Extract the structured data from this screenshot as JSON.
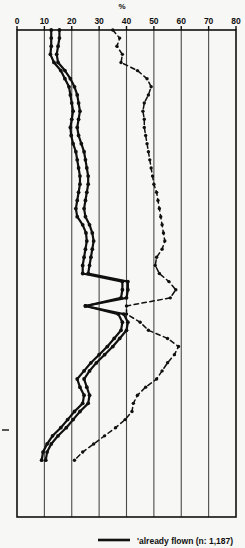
{
  "chart_data": {
    "type": "line",
    "title": "",
    "subtitle": "",
    "xlabel": "%",
    "ylabel": "",
    "xlim": [
      0,
      80
    ],
    "ylim": [
      0,
      60
    ],
    "grid": true,
    "orientation": "vertical-profile",
    "legend_position": "bottom",
    "xticks": [
      0,
      10,
      20,
      30,
      40,
      50,
      60,
      70,
      80
    ],
    "xtick_labels": [
      "0",
      "10",
      "20",
      "30",
      "40",
      "50",
      "60",
      "70",
      "80"
    ],
    "annotations": [],
    "series": [
      {
        "name": "'already flown (n: 1,187)",
        "style": "solid",
        "marker": "dot",
        "color": "#101010",
        "legend": true,
        "x": [
          12.5,
          12.5,
          12.5,
          12.2,
          13.5,
          16.0,
          17.5,
          19.0,
          19.5,
          20.0,
          20.5,
          20.0,
          19.5,
          19.8,
          20.5,
          21.5,
          22.0,
          22.5,
          23.0,
          23.0,
          22.5,
          22.0,
          21.5,
          22.0,
          24.0,
          25.2,
          25.5,
          25.0,
          24.5,
          24.0,
          24.0,
          38.5,
          38.5,
          38.0,
          25.0,
          37.0,
          38.5,
          38.0,
          35.5,
          33.0,
          30.0,
          27.0,
          24.5,
          22.0,
          23.0,
          24.5,
          24.0,
          21.0,
          18.5,
          16.0,
          13.0,
          11.0,
          9.5,
          9.0
        ],
        "y": [
          0,
          1,
          2,
          3,
          4,
          5,
          6,
          7,
          8,
          9,
          10,
          11,
          12,
          13,
          14,
          15,
          16,
          17,
          18,
          19,
          20,
          21,
          22,
          23,
          24,
          25,
          26,
          27,
          28,
          29,
          30,
          31,
          32,
          33,
          34,
          35,
          36,
          37,
          38,
          39,
          40,
          41,
          42,
          43,
          44,
          45,
          46,
          47,
          48,
          49,
          50,
          51,
          52,
          53
        ]
      },
      {
        "name": "second-solid-profile",
        "style": "solid",
        "marker": "dot",
        "color": "#101010",
        "legend": false,
        "x": [
          15.5,
          15.5,
          15.0,
          14.5,
          15.0,
          17.5,
          19.5,
          21.0,
          22.0,
          22.5,
          23.0,
          22.5,
          22.0,
          22.5,
          23.5,
          24.5,
          25.0,
          25.5,
          26.0,
          26.0,
          25.5,
          25.0,
          24.5,
          25.0,
          26.5,
          27.5,
          28.0,
          27.5,
          27.0,
          26.5,
          26.0,
          40.5,
          40.5,
          40.0,
          25.0,
          39.0,
          40.5,
          40.0,
          37.5,
          35.0,
          32.0,
          29.0,
          26.5,
          24.5,
          25.5,
          26.5,
          26.0,
          23.0,
          20.5,
          18.0,
          15.0,
          12.5,
          11.0,
          10.5
        ],
        "y": [
          0,
          1,
          2,
          3,
          4,
          5,
          6,
          7,
          8,
          9,
          10,
          11,
          12,
          13,
          14,
          15,
          16,
          17,
          18,
          19,
          20,
          21,
          22,
          23,
          24,
          25,
          26,
          27,
          28,
          29,
          30,
          31,
          32,
          33,
          34,
          35,
          36,
          37,
          38,
          39,
          40,
          41,
          42,
          43,
          44,
          45,
          46,
          47,
          48,
          49,
          50,
          51,
          52,
          53
        ]
      },
      {
        "name": "dashed-profile",
        "style": "dashed",
        "marker": "dot",
        "color": "#101010",
        "legend": false,
        "x": [
          35.0,
          37.5,
          36.5,
          38.5,
          38.0,
          44.0,
          47.5,
          49.0,
          48.0,
          46.5,
          46.0,
          46.5,
          46.5,
          47.0,
          47.5,
          48.0,
          48.5,
          49.0,
          49.5,
          50.0,
          51.0,
          51.5,
          52.0,
          52.5,
          53.0,
          53.5,
          54.0,
          53.0,
          51.0,
          50.5,
          52.0,
          55.5,
          58.0,
          56.0,
          40.0,
          40.0,
          45.0,
          48.0,
          55.0,
          59.0,
          57.5,
          55.0,
          53.0,
          51.0,
          47.0,
          44.0,
          42.5,
          42.0,
          39.5,
          36.0,
          32.0,
          28.0,
          24.0,
          21.0
        ],
        "y": [
          0,
          1,
          2,
          3,
          4,
          5,
          6,
          7,
          8,
          9,
          10,
          11,
          12,
          13,
          14,
          15,
          16,
          17,
          18,
          19,
          20,
          21,
          22,
          23,
          24,
          25,
          26,
          27,
          28,
          29,
          30,
          31,
          32,
          33,
          34,
          35,
          36,
          37,
          38,
          39,
          40,
          41,
          42,
          43,
          44,
          45,
          46,
          47,
          48,
          49,
          50,
          51,
          52,
          53
        ]
      }
    ],
    "legend_entries": [
      {
        "label": "'already flown (n: 1,187)",
        "style": "solid",
        "color": "#101010"
      }
    ]
  },
  "style": {
    "background": "#f7f7f5",
    "grid_color": "#4a4a4a",
    "frame_color": "#101010",
    "line_color": "#101010"
  }
}
